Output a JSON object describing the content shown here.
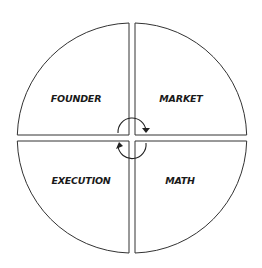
{
  "diagram": {
    "quadrants": [
      {
        "id": "top-left",
        "label": "FOUNDER"
      },
      {
        "id": "top-right",
        "label": "MARKET"
      },
      {
        "id": "bottom-left",
        "label": "EXECUTION"
      },
      {
        "id": "bottom-right",
        "label": "MATH"
      }
    ],
    "center_icon": "cycle-arrows-icon",
    "colors": {
      "stroke": "#333333",
      "text": "#1a1a1a",
      "background": "#ffffff"
    }
  }
}
